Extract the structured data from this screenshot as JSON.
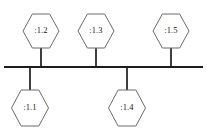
{
  "diagram": {
    "type": "uml-node-bus-diagram",
    "background_color": "#ffffff",
    "bus": {
      "label": "communication-bus",
      "color": "#1c1c1c",
      "x_start": 4,
      "x_end": 203,
      "y": 67,
      "thickness": 2.2
    },
    "connector_color": "#2a2a2a",
    "node_stroke_color": "#6b6b6b",
    "node_fill_color": "#ffffff",
    "label_color": "#1a1a1a",
    "nodes": [
      {
        "id": "node-1-2",
        "label": ":1.2",
        "position": "above",
        "center_x": 41,
        "center_y": 31,
        "width": 36,
        "height": 34,
        "stub_x": 41,
        "stub_y_top": 48,
        "stub_y_bottom": 67
      },
      {
        "id": "node-1-3",
        "label": ":1.3",
        "position": "above",
        "center_x": 96,
        "center_y": 31,
        "width": 36,
        "height": 34,
        "stub_x": 96,
        "stub_y_top": 48,
        "stub_y_bottom": 67
      },
      {
        "id": "node-1-5",
        "label": ":1.5",
        "position": "above",
        "center_x": 171,
        "center_y": 31,
        "width": 36,
        "height": 34,
        "stub_x": 171,
        "stub_y_top": 48,
        "stub_y_bottom": 67
      },
      {
        "id": "node-1-1",
        "label": ":1.1",
        "position": "below",
        "center_x": 30,
        "center_y": 108,
        "width": 37,
        "height": 36,
        "stub_x": 30,
        "stub_y_top": 67,
        "stub_y_bottom": 90
      },
      {
        "id": "node-1-4",
        "label": ":1.4",
        "position": "below",
        "center_x": 127,
        "center_y": 108,
        "width": 37,
        "height": 36,
        "stub_x": 127,
        "stub_y_top": 67,
        "stub_y_bottom": 90
      }
    ]
  }
}
